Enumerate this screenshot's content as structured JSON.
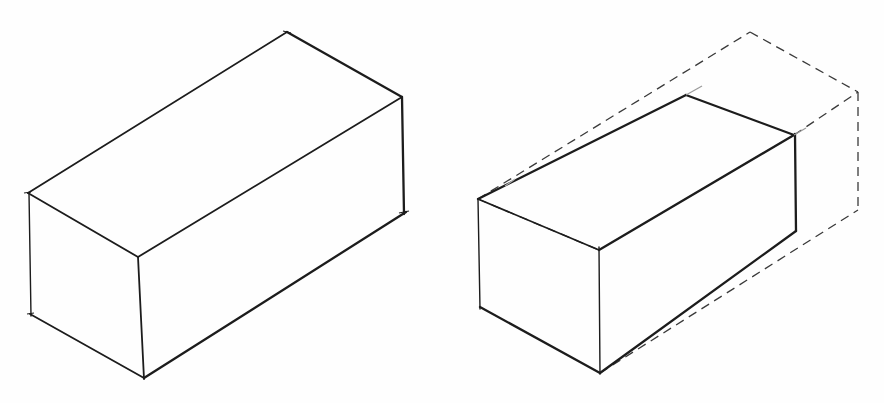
{
  "figure": {
    "description": "Hand-drawn isometric sketches of two rectangular boxes",
    "panels": [
      {
        "id": "left",
        "label": "Isometric rectangular box (solid edges)",
        "style": "solid",
        "vertices": {
          "top_back": [
            287,
            32
          ],
          "top_right": [
            402,
            97
          ],
          "top_left": [
            28,
            193
          ],
          "top_front": [
            138,
            257
          ],
          "bottom_left": [
            31,
            314
          ],
          "bottom_front": [
            144,
            378
          ],
          "bottom_right": [
            404,
            213
          ]
        }
      },
      {
        "id": "right",
        "label": "Smaller box inside dashed isometric bounding box",
        "style": "solid-with-dashed-outline",
        "solid_vertices": {
          "top_left": [
            478,
            199
          ],
          "top_back": [
            686,
            95
          ],
          "top_right": [
            794,
            135
          ],
          "top_front": [
            599,
            250
          ],
          "bottom_left": [
            480,
            307
          ],
          "bottom_front": [
            600,
            373
          ],
          "bottom_right": [
            796,
            231
          ]
        },
        "dashed_vertices": {
          "top_back": [
            750,
            32
          ],
          "top_right": [
            858,
            92
          ],
          "bottom_right": [
            858,
            210
          ]
        }
      }
    ],
    "colors": {
      "line": "#1c1c1c",
      "dashed": "#3a3a3a",
      "background": "#fefefe"
    }
  }
}
